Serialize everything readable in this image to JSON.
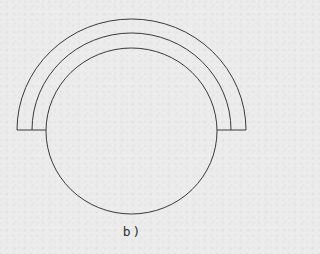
{
  "figure": {
    "caption": "b)",
    "stroke_color": "#3a3a3a",
    "background_color": "#ececec",
    "shapes": {
      "inner_circle": {
        "cx": 131.5,
        "cy": 131,
        "rx": 85.5,
        "ry": 83
      },
      "middle_arc": {
        "cx": 131.5,
        "cy": 131,
        "rx": 99.5,
        "ry": 97
      },
      "outer_arc": {
        "cx": 131.5,
        "cy": 131,
        "rx": 114.5,
        "ry": 111
      },
      "baseline_y": 130
    }
  }
}
